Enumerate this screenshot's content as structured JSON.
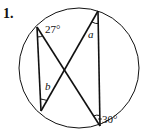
{
  "problem": {
    "number_label": "1."
  },
  "diagram": {
    "circle": {
      "cx": 79,
      "cy": 68,
      "r": 60
    },
    "points": {
      "top_left": [
        37,
        27
      ],
      "top_right": [
        98,
        11
      ],
      "bottom_left": [
        41,
        111
      ],
      "bottom_right": [
        100,
        126
      ]
    },
    "chords": [
      [
        "top_left",
        "bottom_left"
      ],
      [
        "top_left",
        "bottom_right"
      ],
      [
        "top_right",
        "bottom_left"
      ],
      [
        "top_right",
        "bottom_right"
      ]
    ],
    "labels": {
      "angle_top_left": "27°",
      "angle_top_right": "a",
      "angle_bottom_left": "b",
      "angle_bottom_right": "30°"
    },
    "stroke_color": "#111111"
  }
}
